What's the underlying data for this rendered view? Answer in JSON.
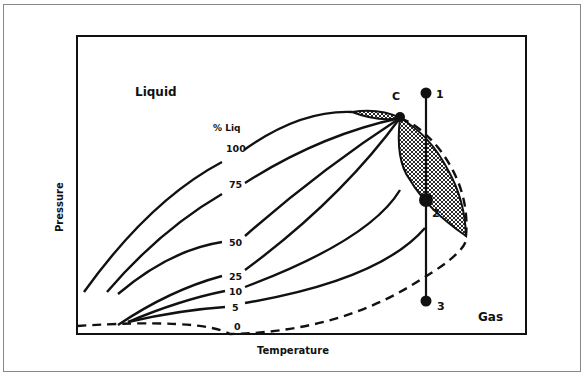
{
  "diagram": {
    "type": "pressure-temperature phase diagram (retrograde condensation)",
    "axes": {
      "x_label": "Temperature",
      "y_label": "Pressure"
    },
    "regions": {
      "liquid": "Liquid",
      "gas": "Gas"
    },
    "quality_header": "% Liq",
    "quality_lines": [
      "100",
      "75",
      "50",
      "25",
      "10",
      "5",
      "0"
    ],
    "critical_point": "C",
    "path_points": [
      "1",
      "2",
      "3"
    ]
  }
}
